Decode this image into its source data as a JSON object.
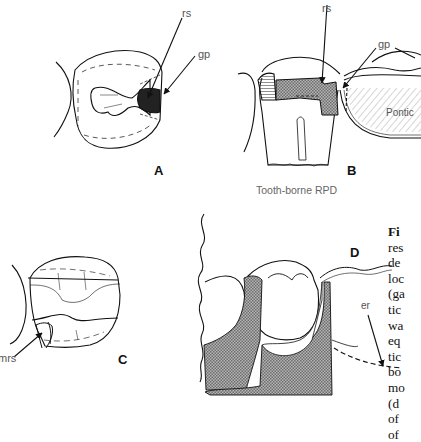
{
  "figure": {
    "panels": {
      "A": {
        "label": "A",
        "annotations": [
          "rs",
          "gp"
        ]
      },
      "B": {
        "label": "B",
        "annotations": [
          "rs",
          "gp",
          "Pontic"
        ],
        "caption": "Tooth-borne RPD"
      },
      "C": {
        "label": "C",
        "annotations": [
          "mrs"
        ]
      },
      "D": {
        "label": "D",
        "annotations": [
          "er"
        ]
      }
    },
    "side_text": {
      "lines": [
        "Fi",
        "res",
        "de",
        "loc",
        "(ga",
        "tic",
        "wa",
        "eq",
        "tic",
        "bo",
        "mo",
        "(d",
        "of",
        "of"
      ]
    },
    "colors": {
      "line": "#111111",
      "label": "#555555",
      "fill_stipple": "#9a9a9a",
      "background": "#ffffff"
    }
  }
}
